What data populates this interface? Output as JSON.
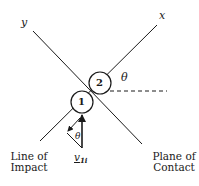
{
  "diagram": {
    "axes": {
      "x_label": "x",
      "y_label": "y"
    },
    "particles": [
      {
        "id": "1",
        "label": "1",
        "cx": 82,
        "cy": 102,
        "r": 11
      },
      {
        "id": "2",
        "label": "2",
        "cx": 100,
        "cy": 83,
        "r": 11
      }
    ],
    "angles": {
      "theta_top": "θ",
      "theta_bottom": "θ"
    },
    "vector": {
      "symbol": "v",
      "subscript": "1i"
    },
    "labels": {
      "line_of_impact_line1": "Line of",
      "line_of_impact_line2": "Impact",
      "plane_of_contact_line1": "Plane of",
      "plane_of_contact_line2": "Contact"
    },
    "colors": {
      "stroke": "#1a1a1a",
      "background": "#ffffff"
    }
  }
}
